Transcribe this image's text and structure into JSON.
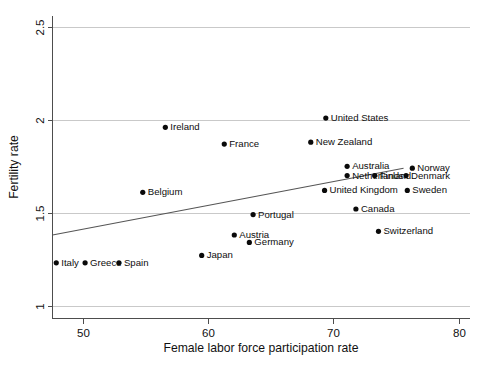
{
  "chart_data": {
    "type": "scatter",
    "title": "",
    "xlabel": "Female labor force participation rate",
    "ylabel": "Fertility rate",
    "xlim": [
      47.6,
      80.9
    ],
    "ylim": [
      0.93,
      2.56
    ],
    "xticks": [
      50,
      60,
      70,
      80
    ],
    "xtick_labels": [
      "50",
      "60",
      "70",
      "80"
    ],
    "yticks": [
      1,
      1.5,
      2,
      2.5
    ],
    "ytick_labels": [
      "1",
      "1.5",
      "2",
      "2.5"
    ],
    "grid": "horizontal",
    "legend": "none",
    "marker_color": "#0a0a0a",
    "gridline_color": "#c9c9c9",
    "axis_color": "#4d4d4d",
    "trendline_color": "#555555",
    "trendline": {
      "x": [
        47.6,
        75.6
      ],
      "y": [
        1.38,
        1.74
      ]
    },
    "points": [
      {
        "name": "Ireland",
        "x": 56.6,
        "y": 1.96,
        "label_side": "right"
      },
      {
        "name": "France",
        "x": 61.3,
        "y": 1.87,
        "label_side": "right"
      },
      {
        "name": "United States",
        "x": 69.4,
        "y": 2.01,
        "label_side": "right"
      },
      {
        "name": "New Zealand",
        "x": 68.2,
        "y": 1.88,
        "label_side": "right"
      },
      {
        "name": "Australia",
        "x": 71.1,
        "y": 1.75,
        "label_side": "right"
      },
      {
        "name": "Netherlands",
        "x": 71.1,
        "y": 1.7,
        "label_side": "right"
      },
      {
        "name": "Finland",
        "x": 73.3,
        "y": 1.7,
        "label_side": "right"
      },
      {
        "name": "Norway",
        "x": 76.3,
        "y": 1.74,
        "label_side": "right"
      },
      {
        "name": "Denmark",
        "x": 75.8,
        "y": 1.7,
        "label_side": "right"
      },
      {
        "name": "United Kingdom",
        "x": 69.3,
        "y": 1.62,
        "label_side": "right"
      },
      {
        "name": "Sweden",
        "x": 75.9,
        "y": 1.62,
        "label_side": "right"
      },
      {
        "name": "Belgium",
        "x": 54.8,
        "y": 1.61,
        "label_side": "right"
      },
      {
        "name": "Canada",
        "x": 71.8,
        "y": 1.52,
        "label_side": "right"
      },
      {
        "name": "Portugal",
        "x": 63.6,
        "y": 1.49,
        "label_side": "right"
      },
      {
        "name": "Switzerland",
        "x": 73.6,
        "y": 1.4,
        "label_side": "right"
      },
      {
        "name": "Austria",
        "x": 62.1,
        "y": 1.38,
        "label_side": "right"
      },
      {
        "name": "Germany",
        "x": 63.3,
        "y": 1.34,
        "label_side": "right"
      },
      {
        "name": "Japan",
        "x": 59.5,
        "y": 1.27,
        "label_side": "right"
      },
      {
        "name": "Italy",
        "x": 47.9,
        "y": 1.23,
        "label_side": "right"
      },
      {
        "name": "Greece",
        "x": 50.2,
        "y": 1.23,
        "label_side": "right"
      },
      {
        "name": "Spain",
        "x": 52.9,
        "y": 1.23,
        "label_side": "right"
      }
    ]
  }
}
